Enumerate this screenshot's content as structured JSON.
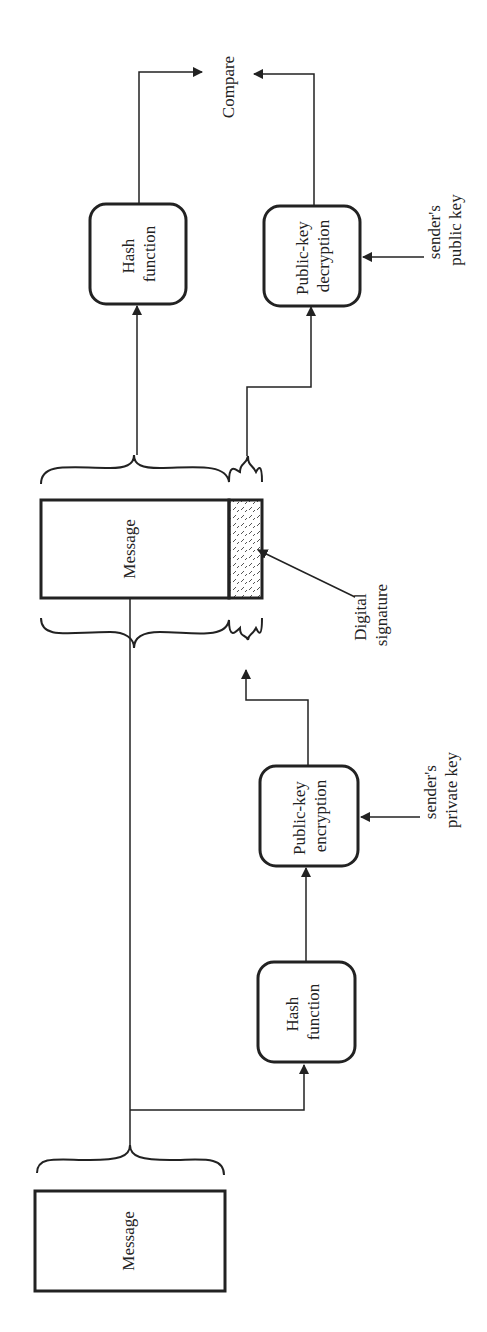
{
  "diagram": {
    "orientation": "rotated -90deg (text reads bottom-to-top)",
    "nodes": {
      "original_message": {
        "label": "Message"
      },
      "hash_function_sender": {
        "label_line1": "Hash",
        "label_line2": "function"
      },
      "pk_encryption": {
        "label_line1": "Public-key",
        "label_line2": "encryption"
      },
      "signed_message": {
        "label": "Message"
      },
      "digital_signature": {
        "label_line1": "Digital",
        "label_line2": "signature"
      },
      "hash_function_receiver": {
        "label_line1": "Hash",
        "label_line2": "function"
      },
      "pk_decryption": {
        "label_line1": "Public-key",
        "label_line2": "decryption"
      },
      "compare": {
        "label": "Compare"
      }
    },
    "inputs": {
      "private_key": {
        "label_line1": "sender's",
        "label_line2": "private key"
      },
      "public_key": {
        "label_line1": "sender's",
        "label_line2": "public key"
      }
    },
    "edges": [
      {
        "from": "original_message",
        "to": "signed_message"
      },
      {
        "from": "original_message",
        "to": "hash_function_sender"
      },
      {
        "from": "hash_function_sender",
        "to": "pk_encryption"
      },
      {
        "from": "private_key",
        "to": "pk_encryption"
      },
      {
        "from": "pk_encryption",
        "to": "digital_signature"
      },
      {
        "from": "signed_message",
        "to": "hash_function_receiver"
      },
      {
        "from": "digital_signature",
        "to": "pk_decryption"
      },
      {
        "from": "public_key",
        "to": "pk_decryption"
      },
      {
        "from": "hash_function_receiver",
        "to": "compare"
      },
      {
        "from": "pk_decryption",
        "to": "compare"
      }
    ],
    "colors": {
      "stroke": "#222222",
      "background": "#ffffff",
      "hatch": "#555555"
    }
  }
}
